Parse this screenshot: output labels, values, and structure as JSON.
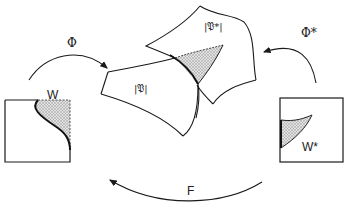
{
  "diagram": {
    "type": "commutative-mapping-diagram",
    "labels": {
      "phi": "Φ",
      "phi_star": "Φ*",
      "f_map": "F",
      "w": "W",
      "w_star": "W*",
      "pattern": "|𝔓|",
      "pattern_star": "|𝔓*|"
    },
    "elements": [
      {
        "id": "square-w",
        "label": "W",
        "shaded_region": "top-right"
      },
      {
        "id": "square-w-star",
        "label": "W*",
        "shaded_region": "upper-left"
      },
      {
        "id": "region-p",
        "label": "|𝔓|"
      },
      {
        "id": "region-p-star",
        "label": "|𝔓*|",
        "shaded_region": "overlap-triangle"
      }
    ],
    "arrows": [
      {
        "from": "square-w",
        "to": "region-p",
        "label": "Φ"
      },
      {
        "from": "square-w-star",
        "to": "region-p-star",
        "label": "Φ*"
      },
      {
        "from": "square-w-star",
        "to": "square-w",
        "label": "F"
      }
    ],
    "colors": {
      "stroke": "#1a1a1a",
      "shade": "#c8c8c8",
      "background": "#ffffff"
    }
  }
}
